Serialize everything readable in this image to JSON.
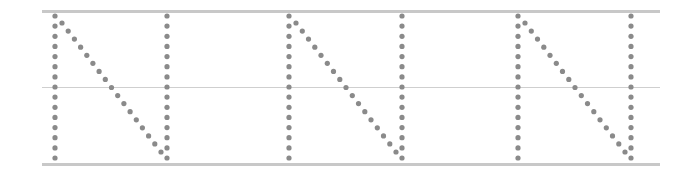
{
  "worksheet": {
    "letter": "N",
    "style": "dotted-tracing",
    "repetitions": 3,
    "colors": {
      "dot": "#8a8a8a",
      "guide_line": "#c8c8c8"
    },
    "guide_lines": {
      "left": 42,
      "right": 660,
      "top_y": 11,
      "mid_y": 87,
      "bottom_y": 164
    },
    "letters": [
      {
        "label": "N",
        "left_x": 55,
        "right_x": 167
      },
      {
        "label": "N",
        "left_x": 289,
        "right_x": 402
      },
      {
        "label": "N",
        "left_x": 518,
        "right_x": 631
      }
    ],
    "dot": {
      "radius": 2.6,
      "top_y": 16,
      "bottom_y": 158,
      "vertical_count": 15,
      "diagonal_count": 17
    }
  }
}
